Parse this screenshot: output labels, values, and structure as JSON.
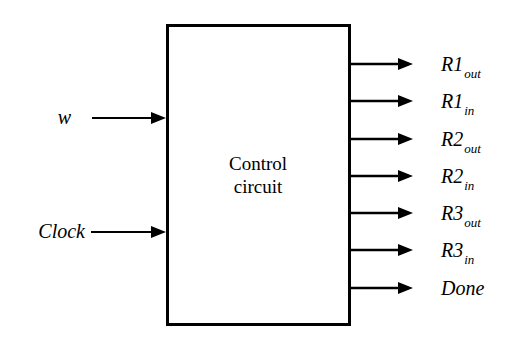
{
  "figure": {
    "kind": "block-diagram",
    "background_color": "#ffffff",
    "line_color": "#000000",
    "canvas": {
      "width": 522,
      "height": 340
    }
  },
  "block": {
    "name": "control-circuit-block",
    "label_line1": "Control",
    "label_line2": "circuit",
    "x": 166,
    "y": 24,
    "width": 185,
    "height": 302,
    "stroke_width": 3,
    "fill": "#ffffff",
    "label_center_x": 258,
    "label_line1_y": 170,
    "label_line2_y": 193
  },
  "inputs": [
    {
      "name": "input-w",
      "label": "w",
      "label_subscript": "",
      "label_x": 71,
      "label_y": 124,
      "wire_y": 118,
      "wire_x1": 92,
      "wire_x2": 166,
      "arrow_tip_x": 166
    },
    {
      "name": "input-clock",
      "label": "Clock",
      "label_subscript": "",
      "label_x": 85,
      "label_y": 238,
      "wire_y": 232,
      "wire_x1": 91,
      "wire_x2": 166,
      "arrow_tip_x": 166
    }
  ],
  "outputs": [
    {
      "name": "output-r1-out",
      "label": "R1",
      "label_subscript": "out",
      "wire_y": 64,
      "label_x": 441,
      "label_y": 71
    },
    {
      "name": "output-r1-in",
      "label": "R1",
      "label_subscript": "in",
      "wire_y": 101,
      "label_x": 441,
      "label_y": 108
    },
    {
      "name": "output-r2-out",
      "label": "R2",
      "label_subscript": "out",
      "wire_y": 139,
      "label_x": 441,
      "label_y": 146
    },
    {
      "name": "output-r2-in",
      "label": "R2",
      "label_subscript": "in",
      "wire_y": 176,
      "label_x": 441,
      "label_y": 183
    },
    {
      "name": "output-r3-out",
      "label": "R3",
      "label_subscript": "out",
      "wire_y": 213,
      "label_x": 441,
      "label_y": 220
    },
    {
      "name": "output-r3-in",
      "label": "R3",
      "label_subscript": "in",
      "wire_y": 250,
      "label_x": 441,
      "label_y": 257
    },
    {
      "name": "output-done",
      "label": "Done",
      "label_subscript": "",
      "wire_y": 288,
      "label_x": 441,
      "label_y": 295
    }
  ],
  "output_wire_geometry": {
    "x_start": 351,
    "x_end": 413,
    "stroke_width": 2.6,
    "arrow_length": 15,
    "arrow_half_height": 6
  },
  "input_wire_geometry": {
    "stroke_width": 2.2,
    "arrow_length": 15,
    "arrow_half_height": 6
  }
}
